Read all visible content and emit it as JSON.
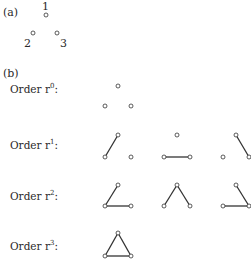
{
  "panel_a": {
    "label": "(a)",
    "nodes": [
      {
        "id": "1",
        "label": "1",
        "x": 46,
        "y": 15
      },
      {
        "id": "2",
        "label": "2",
        "x": 33,
        "y": 33
      },
      {
        "id": "3",
        "label": "3",
        "x": 57,
        "y": 33
      }
    ]
  },
  "panel_b": {
    "label": "(b)",
    "rows": [
      {
        "label": "Order r",
        "power": "0",
        "graphs": [
          {
            "offset_x": 0,
            "edges": []
          }
        ]
      },
      {
        "label": "Order r",
        "power": "1",
        "graphs": [
          {
            "edges": [
              [
                "top",
                "bl"
              ]
            ]
          },
          {
            "edges": [
              [
                "bl",
                "br"
              ]
            ]
          },
          {
            "edges": [
              [
                "top",
                "br"
              ]
            ]
          }
        ]
      },
      {
        "label": "Order r",
        "power": "2",
        "graphs": [
          {
            "edges": [
              [
                "top",
                "bl"
              ],
              [
                "bl",
                "br"
              ]
            ]
          },
          {
            "edges": [
              [
                "top",
                "bl"
              ],
              [
                "top",
                "br"
              ]
            ]
          },
          {
            "edges": [
              [
                "top",
                "br"
              ],
              [
                "bl",
                "br"
              ]
            ]
          }
        ]
      },
      {
        "label": "Order r",
        "power": "3",
        "graphs": [
          {
            "edges": [
              [
                "top",
                "bl"
              ],
              [
                "top",
                "br"
              ],
              [
                "bl",
                "br"
              ]
            ]
          }
        ]
      }
    ]
  },
  "style": {
    "stroke": "#333333",
    "node_fill": "#ffffff"
  }
}
